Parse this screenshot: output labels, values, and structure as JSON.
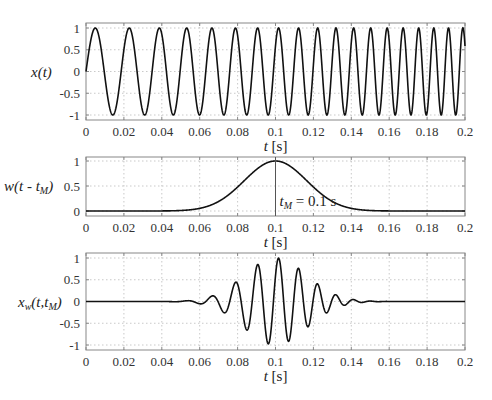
{
  "chart_data": [
    {
      "type": "line",
      "title": "",
      "ylabel": "x(t)",
      "xlabel": "t [s]",
      "xlim": [
        0,
        0.2
      ],
      "ylim": [
        -1.1,
        1.1
      ],
      "xticks": [
        "0",
        "0.02",
        "0.04",
        "0.06",
        "0.08",
        "0.1",
        "0.12",
        "0.14",
        "0.16",
        "0.18",
        "0.2"
      ],
      "yticks": [
        "1",
        "0.5",
        "0",
        "-0.5",
        "-1"
      ],
      "grid": true,
      "series": [
        {
          "name": "chirp",
          "kind": "chirp",
          "f0": 50,
          "k": 420,
          "amplitude": 1
        }
      ],
      "description": "Linear chirp sine wave, amplitude 1, frequency increasing from ~50 Hz to ~135 Hz over 0–0.2 s"
    },
    {
      "type": "line",
      "title": "",
      "ylabel": "w(t-t_M)",
      "xlabel": "t [s]",
      "xlim": [
        0,
        0.2
      ],
      "ylim": [
        -0.08,
        1.08
      ],
      "xticks": [
        "0",
        "0.02",
        "0.04",
        "0.06",
        "0.08",
        "0.1",
        "0.12",
        "0.14",
        "0.16",
        "0.18",
        "0.2"
      ],
      "yticks": [
        "1",
        "0.5",
        "0"
      ],
      "grid": true,
      "series": [
        {
          "name": "window",
          "kind": "gaussian",
          "center": 0.1,
          "sigma": 0.0165
        }
      ],
      "annotation": {
        "text_main": "t",
        "text_sub": "M",
        "text_rest": " = 0.1 s",
        "x": 0.1,
        "vline": true
      },
      "description": "Gaussian window centered at t_M = 0.1 s, peak 1, near zero outside 0.05–0.15 s"
    },
    {
      "type": "line",
      "title": "",
      "ylabel": "x_w(t,t_M)",
      "xlabel": "t [s]",
      "xlim": [
        0,
        0.2
      ],
      "ylim": [
        -1.1,
        1.1
      ],
      "xticks": [
        "0",
        "0.02",
        "0.04",
        "0.06",
        "0.08",
        "0.1",
        "0.12",
        "0.14",
        "0.16",
        "0.18",
        "0.2"
      ],
      "yticks": [
        "1",
        "0.5",
        "0",
        "-0.5",
        "-1"
      ],
      "grid": true,
      "series": [
        {
          "name": "windowed",
          "kind": "product"
        }
      ],
      "description": "Chirp multiplied by Gaussian window; oscillation burst between ~0.055 and ~0.145 s, max amplitude ~1 near 0.1 s"
    }
  ],
  "labels": {
    "top_ylabel": "x(t)",
    "mid_ylabel_main": "w(t - t",
    "mid_ylabel_sub": "M",
    "mid_ylabel_end": ")",
    "bot_ylabel_main": "x",
    "bot_ylabel_sub1": "w",
    "bot_ylabel_mid": "(t,t",
    "bot_ylabel_sub2": "M",
    "bot_ylabel_end": ")",
    "xlabel_t": "t",
    "xlabel_unit": " [s]"
  }
}
